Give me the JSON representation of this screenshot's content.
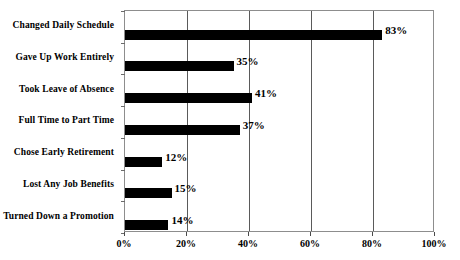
{
  "chart_data": {
    "type": "bar",
    "orientation": "horizontal",
    "title": "",
    "xlabel": "",
    "ylabel": "",
    "xlim": [
      0,
      100
    ],
    "grid": true,
    "legend": "none",
    "x_tick_labels": [
      "0%",
      "20%",
      "40%",
      "60%",
      "80%",
      "100%"
    ],
    "x_tick_values": [
      0,
      20,
      40,
      60,
      80,
      100
    ],
    "categories": [
      "Changed Daily Schedule",
      "Gave Up Work Entirely",
      "Took Leave of Absence",
      "Full Time to Part Time",
      "Chose Early Retirement",
      "Lost Any Job Benefits",
      "Turned Down a Promotion"
    ],
    "values": [
      83,
      35,
      41,
      37,
      12,
      15,
      14
    ],
    "data_labels": [
      "83%",
      "35%",
      "41%",
      "37%",
      "12%",
      "15%",
      "14%"
    ],
    "bar_color": "#000000",
    "plot_border_color": "#8d8d8d",
    "gridline_color": "#5a5a5a",
    "background_color": "#ffffff"
  }
}
